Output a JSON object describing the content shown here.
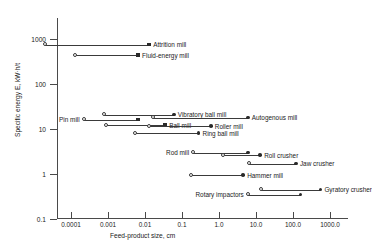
{
  "chart_data": {
    "type": "range-bar",
    "title": "",
    "xlabel": "Feed-product size, cm",
    "ylabel": "Specific energy E, kW·h/t",
    "xscale": "log",
    "yscale": "log",
    "xlim": [
      1e-05,
      10000
    ],
    "ylim": [
      0.1,
      3000
    ],
    "grid": false,
    "legend": "none",
    "xticks": [
      "0.0001",
      "0.001",
      "0.01",
      "0.1",
      "1.0",
      "10.0",
      "100.0",
      "1000.0"
    ],
    "xtick_values": [
      0.0001,
      0.001,
      0.01,
      0.1,
      1.0,
      10.0,
      100.0,
      1000.0
    ],
    "yticks": [
      "1000",
      "100",
      "10",
      "1",
      "0.1"
    ],
    "ytick_values": [
      1000,
      100,
      10,
      1,
      0.1
    ],
    "series": [
      {
        "name": "Attrition mill",
        "y": 750,
        "x_start": 2e-05,
        "x_end": 0.013,
        "label_side": "right",
        "end_marker": "square"
      },
      {
        "name": "Fluid-energy mill",
        "y": 430,
        "x_start": 0.00013,
        "x_end": 0.0065,
        "label_side": "right",
        "end_marker": "square"
      },
      {
        "name": "Vibratory ball mill",
        "y": 21,
        "x_start": 0.0008,
        "x_end": 0.06,
        "label_side": "right",
        "end_marker": "dot"
      },
      {
        "name": "Autogenous mill",
        "y": 18,
        "x_start": 0.016,
        "x_end": 6.0,
        "label_side": "right",
        "end_marker": "dot"
      },
      {
        "name": "Pin mill",
        "y": 16,
        "x_start": 0.00022,
        "x_end": 0.0065,
        "label_side": "left",
        "end_marker": "square"
      },
      {
        "name": "Ball mill",
        "y": 12,
        "x_start": 0.0009,
        "x_end": 0.035,
        "label_side": "right",
        "end_marker": "square"
      },
      {
        "name": "Roller mill",
        "y": 11.5,
        "x_start": 0.013,
        "x_end": 0.6,
        "label_side": "right",
        "end_marker": "dot"
      },
      {
        "name": "Ring ball mill",
        "y": 8,
        "x_start": 0.0055,
        "x_end": 0.28,
        "label_side": "right",
        "end_marker": "dot"
      },
      {
        "name": "Rod mill",
        "y": 3.0,
        "x_start": 0.2,
        "x_end": 6.0,
        "label_side": "left",
        "end_marker": "dot"
      },
      {
        "name": "Roll crusher",
        "y": 2.6,
        "x_start": 1.3,
        "x_end": 13.0,
        "label_side": "right",
        "end_marker": "dot"
      },
      {
        "name": "Jaw crusher",
        "y": 1.7,
        "x_start": 6.5,
        "x_end": 120.0,
        "label_side": "right",
        "end_marker": "dot"
      },
      {
        "name": "Hammer mill",
        "y": 0.95,
        "x_start": 0.17,
        "x_end": 4.5,
        "label_side": "right",
        "end_marker": "dot"
      },
      {
        "name": "Gyratory crusher",
        "y": 0.45,
        "x_start": 14.0,
        "x_end": 550.0,
        "label_side": "right",
        "end_marker": "dot"
      },
      {
        "name": "Rotary impactors",
        "y": 0.35,
        "x_start": 6.0,
        "x_end": 160.0,
        "label_side": "left",
        "end_marker": "dot"
      }
    ]
  },
  "colors": {
    "axis": "#4a4a4a",
    "series": "#2a2a2a",
    "background": "#ffffff",
    "text": "#1a1a1a"
  }
}
